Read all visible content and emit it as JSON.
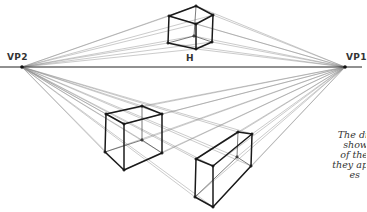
{
  "labels": {
    "vp2": "VP2",
    "vp1": "VP1",
    "horizon": "H"
  },
  "caption": {
    "lines": [
      "The di",
      "show",
      "of the",
      "they ap",
      "es"
    ]
  },
  "colors": {
    "ink": "#1a1a1a",
    "construction": "#8a8a8a",
    "label": "#333333"
  },
  "geometry": {
    "horizon_y": 67,
    "vp2": [
      22,
      67
    ],
    "vp1": [
      345,
      67
    ],
    "boxes": [
      {
        "name": "top-cube",
        "visible_edges": [
          [
            [
              169,
              16
            ],
            [
              196,
              6
            ]
          ],
          [
            [
              196,
              6
            ],
            [
              213,
              15
            ]
          ],
          [
            [
              169,
              16
            ],
            [
              196,
              24
            ]
          ],
          [
            [
              196,
              24
            ],
            [
              213,
              15
            ]
          ],
          [
            [
              169,
              16
            ],
            [
              168,
              43
            ]
          ],
          [
            [
              196,
              24
            ],
            [
              196,
              49
            ]
          ],
          [
            [
              213,
              15
            ],
            [
              212,
              42
            ]
          ],
          [
            [
              168,
              43
            ],
            [
              196,
              49
            ]
          ],
          [
            [
              196,
              49
            ],
            [
              212,
              42
            ]
          ]
        ],
        "hidden_edges": [
          [
            [
              196,
              6
            ],
            [
              194,
              36
            ]
          ],
          [
            [
              168,
              43
            ],
            [
              194,
              36
            ]
          ],
          [
            [
              194,
              36
            ],
            [
              212,
              42
            ]
          ]
        ]
      },
      {
        "name": "left-cube",
        "visible_edges": [
          [
            [
              106,
              114
            ],
            [
              142,
              106
            ]
          ],
          [
            [
              142,
              106
            ],
            [
              162,
              114
            ]
          ],
          [
            [
              106,
              114
            ],
            [
              124,
              124
            ]
          ],
          [
            [
              124,
              124
            ],
            [
              162,
              114
            ]
          ],
          [
            [
              106,
              114
            ],
            [
              105,
              152
            ]
          ],
          [
            [
              124,
              124
            ],
            [
              124,
              170
            ]
          ],
          [
            [
              162,
              114
            ],
            [
              162,
              153
            ]
          ],
          [
            [
              105,
              152
            ],
            [
              124,
              170
            ]
          ],
          [
            [
              124,
              170
            ],
            [
              162,
              153
            ]
          ]
        ],
        "hidden_edges": [
          [
            [
              142,
              106
            ],
            [
              142,
              140
            ]
          ],
          [
            [
              105,
              152
            ],
            [
              142,
              140
            ]
          ],
          [
            [
              142,
              140
            ],
            [
              162,
              153
            ]
          ]
        ]
      },
      {
        "name": "right-box",
        "visible_edges": [
          [
            [
              196,
              159
            ],
            [
              238,
              132
            ]
          ],
          [
            [
              238,
              132
            ],
            [
              252,
              134
            ]
          ],
          [
            [
              196,
              159
            ],
            [
              213,
              166
            ]
          ],
          [
            [
              213,
              166
            ],
            [
              252,
              134
            ]
          ],
          [
            [
              196,
              159
            ],
            [
              195,
              197
            ]
          ],
          [
            [
              213,
              166
            ],
            [
              213,
              207
            ]
          ],
          [
            [
              252,
              134
            ],
            [
              251,
              166
            ]
          ],
          [
            [
              195,
              197
            ],
            [
              213,
              207
            ]
          ],
          [
            [
              213,
              207
            ],
            [
              251,
              166
            ]
          ]
        ],
        "hidden_edges": [
          [
            [
              238,
              132
            ],
            [
              237,
              157
            ]
          ],
          [
            [
              195,
              197
            ],
            [
              237,
              157
            ]
          ],
          [
            [
              237,
              157
            ],
            [
              251,
              166
            ]
          ]
        ]
      }
    ]
  }
}
